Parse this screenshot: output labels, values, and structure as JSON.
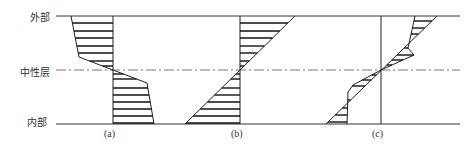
{
  "labels": {
    "outer": "外部",
    "neutral": "中性层",
    "inner": "内部"
  },
  "captions": [
    "(a)",
    "(b)",
    "(c)"
  ],
  "colors": {
    "line": "#222222",
    "hatch": "#111111",
    "text": "#333333"
  },
  "diagram": {
    "title": "",
    "panels": [
      {
        "id": "a",
        "description": "stress distribution: tension outside, compression inside, with steep change near neutral layer"
      },
      {
        "id": "b",
        "description": "linear stress distribution crossing zero at neutral layer"
      },
      {
        "id": "c",
        "description": "stepped linear distribution crossing zero at neutral layer"
      }
    ]
  }
}
